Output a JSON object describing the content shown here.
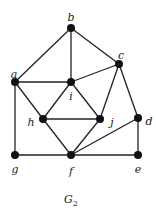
{
  "caption": "G",
  "caption_sub": "2",
  "nodes": [
    {
      "id": "a",
      "x": 15,
      "y": 82,
      "lx": 14,
      "ly": 75
    },
    {
      "id": "b",
      "x": 71,
      "y": 28,
      "lx": 71,
      "ly": 18
    },
    {
      "id": "c",
      "x": 119,
      "y": 64,
      "lx": 121,
      "ly": 56
    },
    {
      "id": "d",
      "x": 138,
      "y": 118,
      "lx": 149,
      "ly": 122
    },
    {
      "id": "e",
      "x": 138,
      "y": 155,
      "lx": 138,
      "ly": 170
    },
    {
      "id": "f",
      "x": 71,
      "y": 155,
      "lx": 71,
      "ly": 172
    },
    {
      "id": "g",
      "x": 15,
      "y": 155,
      "lx": 15,
      "ly": 170
    },
    {
      "id": "h",
      "x": 43,
      "y": 119,
      "lx": 31,
      "ly": 123
    },
    {
      "id": "i",
      "x": 71,
      "y": 82,
      "lx": 71,
      "ly": 97
    },
    {
      "id": "j",
      "x": 100,
      "y": 119,
      "lx": 112,
      "ly": 123
    }
  ],
  "edges": [
    [
      "a",
      "b"
    ],
    [
      "b",
      "i"
    ],
    [
      "b",
      "c"
    ],
    [
      "a",
      "i"
    ],
    [
      "c",
      "i"
    ],
    [
      "a",
      "g"
    ],
    [
      "a",
      "h"
    ],
    [
      "i",
      "h"
    ],
    [
      "i",
      "j"
    ],
    [
      "c",
      "j"
    ],
    [
      "c",
      "d"
    ],
    [
      "h",
      "j"
    ],
    [
      "h",
      "f"
    ],
    [
      "j",
      "f"
    ],
    [
      "f",
      "d"
    ],
    [
      "g",
      "f"
    ],
    [
      "f",
      "e"
    ],
    [
      "d",
      "e"
    ]
  ]
}
